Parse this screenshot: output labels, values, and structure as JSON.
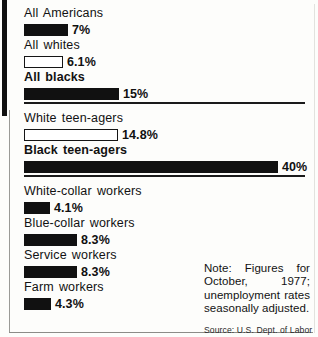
{
  "chart_data": {
    "type": "bar",
    "title": "",
    "subtitle": "",
    "xlabel": "",
    "ylabel": "",
    "orientation": "horizontal",
    "unit": "%",
    "xlim": [
      0,
      40
    ],
    "grid": false,
    "legend": null,
    "categories": [
      "All Americans",
      "All whites",
      "All blacks",
      "White teen-agers",
      "Black teen-agers",
      "White-collar workers",
      "Blue-collar workers",
      "Service workers",
      "Farm workers"
    ],
    "values": [
      7,
      6.1,
      15,
      14.8,
      40,
      4.1,
      8.3,
      8.3,
      4.3
    ],
    "value_labels": [
      "7%",
      "6.1%",
      "15%",
      "14.8%",
      "40%",
      "4.1%",
      "8.3%",
      "8.3%",
      "4.3%"
    ],
    "groups": [
      {
        "name": "overall",
        "bars": [
          {
            "label": "All Americans",
            "value": 7,
            "value_label": "7%",
            "fill": "solid",
            "label_bold": false
          },
          {
            "label": "All whites",
            "value": 6.1,
            "value_label": "6.1%",
            "fill": "hollow",
            "label_bold": false
          },
          {
            "label": "All blacks",
            "value": 15,
            "value_label": "15%",
            "fill": "solid",
            "label_bold": true
          }
        ]
      },
      {
        "name": "teen-agers",
        "bars": [
          {
            "label": "White teen-agers",
            "value": 14.8,
            "value_label": "14.8%",
            "fill": "hollow",
            "label_bold": false
          },
          {
            "label": "Black teen-agers",
            "value": 40,
            "value_label": "40%",
            "fill": "solid",
            "label_bold": true
          }
        ]
      },
      {
        "name": "occupations",
        "bars": [
          {
            "label": "White-collar workers",
            "value": 4.1,
            "value_label": "4.1%",
            "fill": "solid",
            "label_bold": false
          },
          {
            "label": "Blue-collar workers",
            "value": 8.3,
            "value_label": "8.3%",
            "fill": "solid",
            "label_bold": false
          },
          {
            "label": "Service workers",
            "value": 8.3,
            "value_label": "8.3%",
            "fill": "solid",
            "label_bold": false
          },
          {
            "label": "Farm workers",
            "value": 4.3,
            "value_label": "4.3%",
            "fill": "solid",
            "label_bold": false
          }
        ]
      }
    ],
    "annotations": {
      "note": "Note: Figures for October, 1977; unemployment rates seasonally adjusted.",
      "source": "Source: U.S. Dept. of Labor"
    },
    "colors": {
      "bar_solid": "#111111",
      "bar_hollow_fill": "#ffffff",
      "bar_outline": "#151515",
      "text": "#121212",
      "background": "#fdfdfb",
      "divider": "#1a1a1a"
    }
  }
}
